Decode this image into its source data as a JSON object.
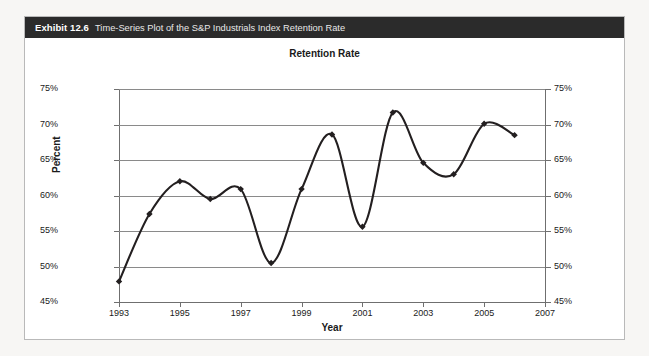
{
  "exhibit": {
    "label": "Exhibit 12.6",
    "caption": "Time-Series Plot of the S&P Industrials Index Retention Rate"
  },
  "colors": {
    "header_bg": "#2b2b2b",
    "header_text": "#ffffff",
    "series_line": "#231f20",
    "gridline": "#8a8a8a",
    "axis": "#6f6f6f",
    "plot_bg": "#ffffff"
  },
  "chart_data": {
    "type": "line",
    "title": "Retention Rate",
    "xlabel": "Year",
    "ylabel": "Percent",
    "grid": true,
    "legend": false,
    "xlim": [
      1993,
      2007
    ],
    "ylim": [
      45,
      75
    ],
    "x_ticks": [
      1993,
      1995,
      1997,
      1999,
      2001,
      2003,
      2005,
      2007
    ],
    "x_tick_labels": [
      "1993",
      "1995",
      "1997",
      "1999",
      "2001",
      "2003",
      "2005",
      "2007"
    ],
    "y_ticks": [
      45,
      50,
      55,
      60,
      65,
      70,
      75
    ],
    "y_tick_labels_left": [
      "45%",
      "50%",
      "55%",
      "60%",
      "65%",
      "70%",
      "75%"
    ],
    "y_tick_labels_right": [
      "45%",
      "50%",
      "55%",
      "60%",
      "65%",
      "70%",
      "75%"
    ],
    "dual_y_axis": true,
    "marker": "diamond",
    "smoothing": "spline",
    "x": [
      1993,
      1994,
      1995,
      1996,
      1997,
      1998,
      1999,
      2000,
      2001,
      2002,
      2003,
      2004,
      2005,
      2006
    ],
    "values": [
      47.9,
      57.4,
      62.0,
      59.5,
      60.9,
      50.5,
      60.9,
      68.6,
      55.6,
      71.7,
      64.6,
      63.0,
      70.1,
      68.5
    ],
    "series": [
      {
        "name": "Retention Rate",
        "values": [
          47.9,
          57.4,
          62.0,
          59.5,
          60.9,
          50.5,
          60.9,
          68.6,
          55.6,
          71.7,
          64.6,
          63.0,
          70.1,
          68.5
        ]
      }
    ]
  }
}
